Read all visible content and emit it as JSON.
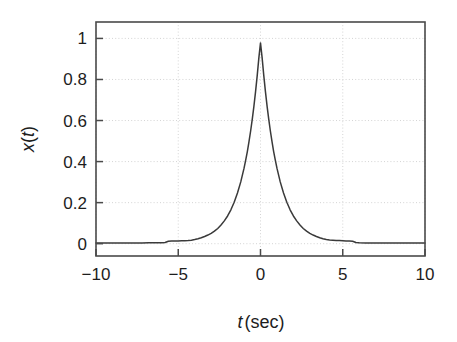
{
  "figure": {
    "background_color": "#ffffff",
    "axis_color": "#4a4a4a",
    "curve_color": "#3a3a3a",
    "grid_color": "#cfcfcf"
  },
  "axes": {
    "x_label_var": "t",
    "x_label_unit": "(sec)",
    "y_label_var": "x",
    "y_label_paren_open": "(",
    "y_label_var2": "t",
    "y_label_paren_close": ")",
    "x_tick_labels": [
      "−10",
      "−5",
      "0",
      "5",
      "10"
    ],
    "y_tick_labels": [
      "0",
      "0.2",
      "0.4",
      "0.6",
      "0.8",
      "1"
    ]
  },
  "chart_data": {
    "type": "line",
    "title": "",
    "xlabel": "t (sec)",
    "ylabel": "x(t)",
    "xlim": [
      -10,
      10
    ],
    "ylim": [
      -0.06,
      1.08
    ],
    "xticks": [
      -10,
      -5,
      0,
      5,
      10
    ],
    "yticks": [
      0,
      0.2,
      0.4,
      0.6,
      0.8,
      1
    ],
    "grid": true,
    "legend": "none",
    "series": [
      {
        "name": "x(t)",
        "color": "#3a3a3a",
        "x": [
          -10.0,
          -9.6,
          -9.2,
          -8.8,
          -8.4,
          -8.0,
          -7.6,
          -7.2,
          -6.8,
          -6.4,
          -6.0,
          -5.8,
          -5.6,
          -5.4,
          -5.2,
          -5.0,
          -4.8,
          -4.6,
          -4.4,
          -4.2,
          -4.0,
          -3.8,
          -3.6,
          -3.4,
          -3.2,
          -3.0,
          -2.8,
          -2.6,
          -2.4,
          -2.2,
          -2.0,
          -1.8,
          -1.6,
          -1.4,
          -1.2,
          -1.0,
          -0.9,
          -0.8,
          -0.7,
          -0.6,
          -0.5,
          -0.4,
          -0.3,
          -0.2,
          -0.1,
          0.0,
          0.1,
          0.2,
          0.3,
          0.4,
          0.5,
          0.6,
          0.7,
          0.8,
          0.9,
          1.0,
          1.2,
          1.4,
          1.6,
          1.8,
          2.0,
          2.2,
          2.4,
          2.6,
          2.8,
          3.0,
          3.2,
          3.4,
          3.6,
          3.8,
          4.0,
          4.2,
          4.4,
          4.6,
          4.8,
          5.0,
          5.2,
          5.4,
          5.6,
          5.8,
          6.0,
          6.4,
          6.8,
          7.2,
          7.6,
          8.0,
          8.4,
          8.8,
          9.2,
          9.6,
          10.0
        ],
        "y": [
          0.003,
          0.003,
          0.003,
          0.003,
          0.003,
          0.003,
          0.003,
          0.003,
          0.004,
          0.004,
          0.004,
          0.006,
          0.012,
          0.013,
          0.013,
          0.013,
          0.014,
          0.014,
          0.015,
          0.017,
          0.02,
          0.024,
          0.029,
          0.035,
          0.042,
          0.05,
          0.061,
          0.074,
          0.091,
          0.111,
          0.135,
          0.165,
          0.202,
          0.247,
          0.301,
          0.368,
          0.407,
          0.449,
          0.497,
          0.549,
          0.607,
          0.67,
          0.741,
          0.819,
          0.905,
          0.978,
          0.905,
          0.819,
          0.741,
          0.67,
          0.607,
          0.549,
          0.497,
          0.449,
          0.407,
          0.368,
          0.301,
          0.247,
          0.202,
          0.165,
          0.135,
          0.111,
          0.091,
          0.074,
          0.061,
          0.05,
          0.042,
          0.035,
          0.029,
          0.024,
          0.02,
          0.018,
          0.017,
          0.016,
          0.015,
          0.014,
          0.013,
          0.013,
          0.012,
          0.006,
          0.004,
          0.003,
          0.003,
          0.003,
          0.003,
          0.003,
          0.003,
          0.003,
          0.003,
          0.003,
          0.003
        ]
      }
    ]
  }
}
